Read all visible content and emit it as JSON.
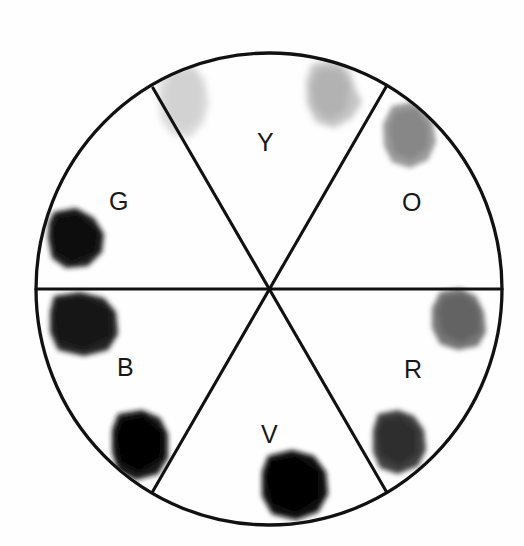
{
  "figure": {
    "type": "color-wheel-sector-diagram",
    "background_color": "#ffffff",
    "outline_color": "#111111",
    "canvas": {
      "width": 524,
      "height": 546
    }
  },
  "circle": {
    "center_x": 269,
    "center_y": 289,
    "radius_x": 234,
    "radius_y": 236,
    "stroke_width": 3.2
  },
  "spokes": [
    {
      "name": "horizontal-diameter",
      "angle_deg": 0
    },
    {
      "name": "diagonal-diameter-a",
      "angle_deg": 60
    },
    {
      "name": "diagonal-diameter-b",
      "angle_deg": 120
    }
  ],
  "sectors": [
    {
      "id": "Y",
      "label": "Y",
      "name": "yellow",
      "label_x": 257,
      "label_y": 130,
      "angular_span_deg": [
        60,
        120
      ],
      "blob_count": 2,
      "blob_darkness": "very-light"
    },
    {
      "id": "O",
      "label": "O",
      "name": "orange",
      "label_x": 402,
      "label_y": 190,
      "angular_span_deg": [
        0,
        60
      ],
      "blob_count": 1,
      "blob_darkness": "medium"
    },
    {
      "id": "R",
      "label": "R",
      "name": "red",
      "label_x": 404,
      "label_y": 357,
      "angular_span_deg": [
        300,
        360
      ],
      "blob_count": 2,
      "blob_darkness": "medium-dark"
    },
    {
      "id": "V",
      "label": "V",
      "name": "violet",
      "label_x": 261,
      "label_y": 422,
      "angular_span_deg": [
        240,
        300
      ],
      "blob_count": 1,
      "blob_darkness": "black"
    },
    {
      "id": "B",
      "label": "B",
      "name": "blue",
      "label_x": 117,
      "label_y": 355,
      "angular_span_deg": [
        180,
        240
      ],
      "blob_count": 2,
      "blob_darkness": "very-dark"
    },
    {
      "id": "G",
      "label": "G",
      "name": "green",
      "label_x": 109,
      "label_y": 189,
      "angular_span_deg": [
        120,
        180
      ],
      "blob_count": 1,
      "blob_darkness": "very-dark"
    }
  ],
  "blobs": [
    {
      "id": "y-blob-1",
      "sector": "Y",
      "cx": 184,
      "cy": 100,
      "rx": 25,
      "ry": 36,
      "fill": "#d9d9d9",
      "rotate": -8,
      "blur": 3.2
    },
    {
      "id": "y-blob-2",
      "sector": "Y",
      "cx": 333,
      "cy": 94,
      "rx": 27,
      "ry": 34,
      "fill": "#b9b9b9",
      "rotate": 6,
      "blur": 3.0
    },
    {
      "id": "o-blob-1",
      "sector": "O",
      "cx": 410,
      "cy": 136,
      "rx": 26,
      "ry": 31,
      "fill": "#8e8e8e",
      "rotate": -10,
      "blur": 2.6
    },
    {
      "id": "r-blob-1",
      "sector": "R",
      "cx": 459,
      "cy": 319,
      "rx": 26,
      "ry": 30,
      "fill": "#6e6e6e",
      "rotate": 8,
      "blur": 2.4
    },
    {
      "id": "r-blob-2",
      "sector": "R",
      "cx": 400,
      "cy": 443,
      "rx": 26,
      "ry": 31,
      "fill": "#3a3a3a",
      "rotate": -6,
      "blur": 2.2
    },
    {
      "id": "v-blob-1",
      "sector": "V",
      "cx": 295,
      "cy": 486,
      "rx": 31,
      "ry": 32,
      "fill": "#0c0c0c",
      "rotate": 12,
      "blur": 2.0
    },
    {
      "id": "b-blob-1",
      "sector": "B",
      "cx": 84,
      "cy": 325,
      "rx": 32,
      "ry": 29,
      "fill": "#1d1d1d",
      "rotate": -5,
      "blur": 2.2
    },
    {
      "id": "b-blob-2",
      "sector": "B",
      "cx": 141,
      "cy": 445,
      "rx": 25,
      "ry": 32,
      "fill": "#131313",
      "rotate": 4,
      "blur": 2.0
    },
    {
      "id": "g-blob-1",
      "sector": "G",
      "cx": 78,
      "cy": 240,
      "rx": 27,
      "ry": 28,
      "fill": "#171717",
      "rotate": -12,
      "blur": 2.2
    }
  ]
}
